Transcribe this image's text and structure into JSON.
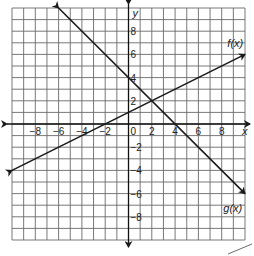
{
  "chart_data": {
    "type": "line",
    "title": "",
    "xlabel": "x",
    "ylabel": "y",
    "xlim": [
      -10,
      10
    ],
    "ylim": [
      -10,
      10
    ],
    "grid": true,
    "x_tick_labels": [
      "-8",
      "-6",
      "-4",
      "-2",
      "0",
      "2",
      "4",
      "6",
      "8"
    ],
    "y_tick_labels": [
      "8",
      "6",
      "4",
      "2",
      "-2",
      "-4",
      "-6",
      "-8"
    ],
    "origin_label": "0",
    "series": [
      {
        "name": "f(x)",
        "equation": "f(x) = 0.5x + 1",
        "points": [
          [
            -10,
            -4
          ],
          [
            -8,
            -3
          ],
          [
            -6,
            -2
          ],
          [
            -4,
            -1
          ],
          [
            -2,
            0
          ],
          [
            0,
            1
          ],
          [
            2,
            2
          ],
          [
            4,
            3
          ],
          [
            6,
            4
          ],
          [
            8,
            5
          ],
          [
            10,
            6
          ]
        ]
      },
      {
        "name": "g(x)",
        "equation": "g(x) = -x + 4",
        "points": [
          [
            -6,
            10
          ],
          [
            -4,
            8
          ],
          [
            -2,
            6
          ],
          [
            0,
            4
          ],
          [
            2,
            2
          ],
          [
            4,
            0
          ],
          [
            6,
            -2
          ],
          [
            8,
            -4
          ],
          [
            10,
            -6
          ]
        ]
      }
    ],
    "annotations": [
      {
        "text": "f(x)",
        "near": [
          9,
          7
        ]
      },
      {
        "text": "g(x)",
        "near": [
          9,
          -7
        ]
      }
    ],
    "intersection": [
      2,
      2
    ]
  },
  "labels": {
    "x_axis": "x",
    "y_axis": "y",
    "origin": "0",
    "f_label": "f(x)",
    "g_label": "g(x)",
    "x_ticks": {
      "n8": "−8",
      "n6": "−6",
      "n4": "−4",
      "n2": "−2",
      "p2": "2",
      "p4": "4",
      "p6": "6",
      "p8": "8"
    },
    "y_ticks": {
      "p8": "8",
      "p6": "6",
      "p4": "4",
      "p2": "2",
      "n2": "−2",
      "n4": "−4",
      "n6": "−6",
      "n8": "−8"
    }
  }
}
